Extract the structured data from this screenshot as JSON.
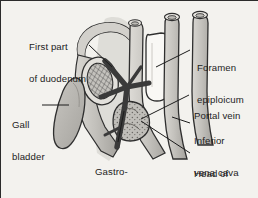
{
  "figure": {
    "background_color": "#f3f2ee",
    "border_color": "#2b2b2b",
    "text_color": "#1c1c1c"
  },
  "labels": {
    "first_part_of_duodenum": {
      "line1": "First part",
      "line2": "of duodenum"
    },
    "gall_bladder": {
      "line1": "Gall",
      "line2": "bladder"
    },
    "gastroduodenal_artery": {
      "line1": "Gastro-",
      "line2": "duodenal",
      "line3": "artery"
    },
    "foramen_epiploicum": {
      "line1": "Foramen",
      "line2": "epiploicum"
    },
    "portal_vein": {
      "line1": "Portal vein"
    },
    "inferior_vena_cava": {
      "line1": "Inferior",
      "line2": "vena cava"
    },
    "head_of_pancreas": {
      "line1": "Head of",
      "line2": "pancreas"
    }
  },
  "structures": {
    "duodenum_loop": {
      "name": "first part of duodenum",
      "fill": "#c9c7c2"
    },
    "duodenum_cut_section": {
      "name": "duodenum cut cross-section",
      "fill": "#b8b6b1",
      "pattern": "cross-hatch"
    },
    "gall_bladder_body": {
      "name": "gall bladder",
      "fill": "#b4b2ad"
    },
    "gastroduodenal_artery_vessel": {
      "name": "gastroduodenal artery",
      "fill": "#3a3a3a"
    },
    "portal_vein_tube": {
      "name": "portal vein",
      "fill": "#b5b3ae"
    },
    "inferior_vena_cava_tube": {
      "name": "inferior vena cava",
      "fill": "#b5b3ae"
    },
    "foramen_epiploicum_gap": {
      "name": "foramen epiploicum",
      "fill": "#f7f6f3"
    },
    "pancreas_head_mass": {
      "name": "head of pancreas",
      "fill": "#bab8b3",
      "pattern": "lobulated"
    }
  },
  "colors": {
    "outline": "#2f2f2f",
    "tissue_light": "#d6d4cf",
    "tissue_mid": "#bab8b3",
    "tissue_dark": "#9b9994",
    "artery_dark": "#3a3a3a",
    "leader_line": "#1c1c1c"
  }
}
